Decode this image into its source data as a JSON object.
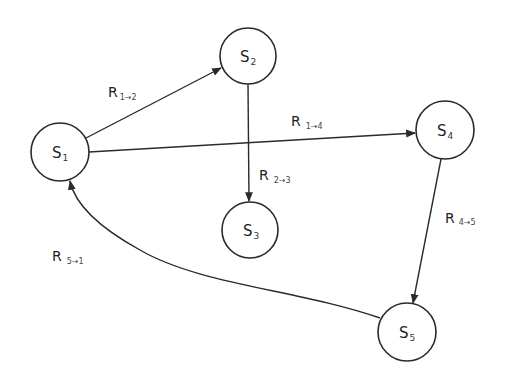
{
  "diagram": {
    "type": "state-transition-graph",
    "nodes": [
      {
        "id": "S1",
        "main": "S",
        "sub": "1",
        "cx": 60,
        "cy": 152,
        "r": 29
      },
      {
        "id": "S2",
        "main": "S",
        "sub": "2",
        "cx": 248,
        "cy": 56,
        "r": 28
      },
      {
        "id": "S3",
        "main": "S",
        "sub": "3",
        "cx": 250,
        "cy": 230,
        "r": 28
      },
      {
        "id": "S4",
        "main": "S",
        "sub": "4",
        "cx": 445,
        "cy": 130,
        "r": 29
      },
      {
        "id": "S5",
        "main": "S",
        "sub": "5",
        "cx": 407,
        "cy": 332,
        "r": 29
      }
    ],
    "edges": [
      {
        "id": "R12",
        "from": "S1",
        "to": "S2",
        "main": "R",
        "sub": "1→2",
        "label_x": 108,
        "label_y": 97
      },
      {
        "id": "R14",
        "from": "S1",
        "to": "S4",
        "main": "R",
        "sub": "1→4",
        "label_x": 291,
        "label_y": 126
      },
      {
        "id": "R23",
        "from": "S2",
        "to": "S3",
        "main": "R",
        "sub": "2→3",
        "label_x": 259,
        "label_y": 180
      },
      {
        "id": "R45",
        "from": "S4",
        "to": "S5",
        "main": "R",
        "sub": "4→5",
        "label_x": 445,
        "label_y": 223
      },
      {
        "id": "R51",
        "from": "S5",
        "to": "S1",
        "main": "R",
        "sub": "5→1",
        "label_x": 52,
        "label_y": 261
      }
    ]
  }
}
